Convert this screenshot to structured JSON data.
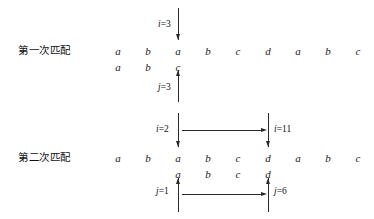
{
  "figure": {
    "sections": [
      {
        "label": "第一次匹配",
        "label_x": 18,
        "label_y": 42,
        "text_row": {
          "chars": [
            "a",
            "b",
            "a",
            "b",
            "c",
            "d",
            "a",
            "b",
            "c"
          ],
          "y": 45
        },
        "pattern_row": {
          "chars": [
            "a",
            "b",
            "c"
          ],
          "start_col": 0,
          "y": 61
        },
        "pointers": [
          {
            "name": "i-pointer",
            "text": "i=3",
            "var": "i",
            "eq": "=3",
            "col": 2,
            "direction": "down",
            "line_top": 8,
            "line_bottom": 40,
            "label_x": 158,
            "label_y": 19
          },
          {
            "name": "j-pointer",
            "text": "j=3",
            "var": "j",
            "eq": "=3",
            "col": 2,
            "direction": "up",
            "line_top": 70,
            "line_bottom": 102,
            "label_x": 158,
            "label_y": 82
          }
        ],
        "spans": []
      },
      {
        "label": "第二次匹配",
        "label_x": 18,
        "label_y": 149,
        "text_row": {
          "chars": [
            "a",
            "b",
            "a",
            "b",
            "c",
            "d",
            "a",
            "b",
            "c"
          ],
          "y": 152
        },
        "pattern_row": {
          "chars": [
            "a",
            "b",
            "c",
            "d"
          ],
          "start_col": 2,
          "y": 168
        },
        "pointers": [
          {
            "name": "i-start-pointer",
            "text": "i=2",
            "var": "i",
            "eq": "=2",
            "col": 2,
            "direction": "down",
            "line_top": 113,
            "line_bottom": 147,
            "label_x": 156,
            "label_y": 124
          },
          {
            "name": "i-end-pointer",
            "text": "i=11",
            "var": "i",
            "eq": "=11",
            "col": 5,
            "direction": "down",
            "line_top": 113,
            "line_bottom": 147,
            "label_x": 274,
            "label_y": 124
          },
          {
            "name": "j-start-pointer",
            "text": "j=1",
            "var": "j",
            "eq": "=1",
            "col": 2,
            "direction": "up",
            "line_top": 178,
            "line_bottom": 212,
            "label_x": 156,
            "label_y": 186
          },
          {
            "name": "j-end-pointer",
            "text": "j=6",
            "var": "j",
            "eq": "=6",
            "col": 5,
            "direction": "up",
            "line_top": 178,
            "line_bottom": 212,
            "label_x": 274,
            "label_y": 186
          }
        ],
        "spans": [
          {
            "name": "i-span-arrow",
            "from_col": 2,
            "to_col": 5,
            "y": 130
          },
          {
            "name": "j-span-arrow",
            "from_col": 2,
            "to_col": 5,
            "y": 194
          }
        ]
      }
    ],
    "geometry": {
      "col_origin_x": 118,
      "col_step_x": 30
    },
    "colors": {
      "ink": "#222222",
      "background": "#ffffff"
    }
  }
}
